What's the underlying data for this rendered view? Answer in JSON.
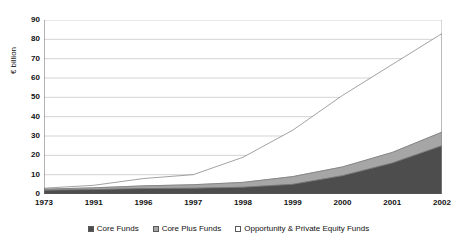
{
  "chart_data": {
    "type": "area",
    "stacked": true,
    "title": "",
    "xlabel": "",
    "ylabel": "€ billion",
    "categories": [
      "1973",
      "1991",
      "1996",
      "1997",
      "1998",
      "1999",
      "2000",
      "2001",
      "2002"
    ],
    "ylim": [
      0,
      90
    ],
    "ytick_step": 10,
    "yticks": [
      "90",
      "80",
      "70",
      "60",
      "50",
      "40",
      "30",
      "20",
      "10",
      "0"
    ],
    "grid": true,
    "grid_axis": "y",
    "legend_position": "bottom",
    "series": [
      {
        "name": "Core Funds",
        "color": "#4d4d4d",
        "values": [
          2.0,
          2.3,
          2.8,
          3.0,
          3.5,
          5.0,
          9.5,
          16.0,
          25.0
        ]
      },
      {
        "name": "Core Plus Funds",
        "color": "#a6a6a6",
        "values": [
          0.5,
          0.9,
          1.4,
          1.8,
          2.5,
          4.0,
          4.5,
          5.5,
          7.0
        ]
      },
      {
        "name": "Opportunity & Private Equity Funds",
        "color": "#ffffff",
        "values": [
          0.5,
          1.3,
          3.8,
          5.2,
          13.0,
          24.0,
          37.0,
          45.5,
          51.0
        ]
      }
    ],
    "totals": [
      3.0,
      4.5,
      8.0,
      10.0,
      19.0,
      33.0,
      51.0,
      67.0,
      83.0
    ]
  },
  "legend": {
    "items": [
      {
        "label": "Core Funds"
      },
      {
        "label": "Core Plus Funds"
      },
      {
        "label": "Opportunity & Private Equity Funds"
      }
    ]
  }
}
